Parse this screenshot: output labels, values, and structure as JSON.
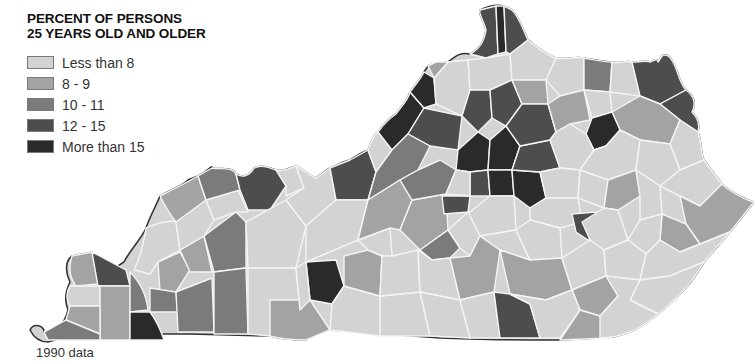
{
  "title": {
    "line1": "PERCENT OF PERSONS",
    "line2": "25 YEARS OLD AND OLDER"
  },
  "legend": {
    "items": [
      {
        "label": "Less than 8",
        "color": "#d3d3d3"
      },
      {
        "label": "8 - 9",
        "color": "#a3a3a3"
      },
      {
        "label": "10 - 11",
        "color": "#7b7b7b"
      },
      {
        "label": "12 - 15",
        "color": "#4d4d4d"
      },
      {
        "label": "More than 15",
        "color": "#2a2a2a"
      }
    ]
  },
  "caption": "1990 data",
  "map": {
    "region": "Kentucky counties",
    "outline_color": "#333333",
    "county_border_color": "#f4f4f4"
  }
}
